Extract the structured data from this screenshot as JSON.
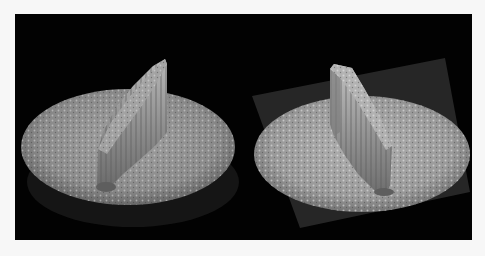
{
  "figure": {
    "background": "#020202",
    "page_background": "#f7f7f7",
    "panels": [
      {
        "id": "left",
        "description": "3D surface rendering: textured circular disc with a tall ridge-shaped wall rising along a diagonal",
        "base_plane": "none visible",
        "disc_color": "#8a8a8a",
        "ridge_color": "#a8a8a8"
      },
      {
        "id": "right",
        "description": "3D surface rendering: textured circular disc on a dark tilted square plane with a tall ridge wall rising along a diagonal",
        "base_plane": "dark gray tilted square",
        "disc_color": "#9a9a9a",
        "ridge_color": "#b0b0b0"
      }
    ]
  }
}
